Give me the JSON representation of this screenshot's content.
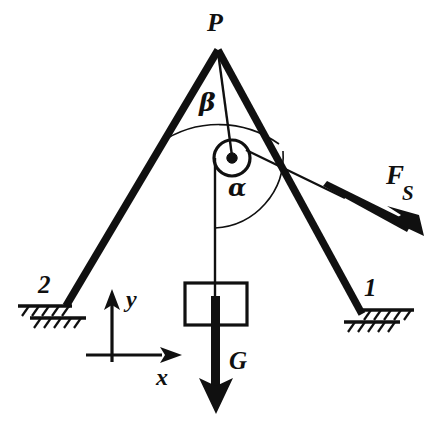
{
  "figure": {
    "background_color": "#ffffff",
    "ink_color": "#101010"
  },
  "labels": {
    "apex": "P",
    "angle_beta": "β",
    "angle_alpha": "α",
    "support_left": "2",
    "support_right": "1",
    "force_cable_symbol": "F",
    "force_cable_subscript": "S",
    "force_weight": "G",
    "axis_x": "x",
    "axis_y": "y"
  },
  "geometry": {
    "apex_point": {
      "x": 218,
      "y": 48
    },
    "support_left_point": {
      "x": 66,
      "y": 306
    },
    "support_right_point": {
      "x": 362,
      "y": 314
    },
    "pulley_center": {
      "x": 232,
      "y": 158
    },
    "pulley_radius": 18,
    "pulley_hub_radius": 5,
    "cable_vertical_x": 215,
    "block_rect": {
      "x": 185,
      "y": 283,
      "w": 62,
      "h": 42
    },
    "weight_arrow_tip": {
      "x": 216,
      "y": 412
    },
    "cable_force_arrow_tip": {
      "x": 418,
      "y": 232
    },
    "axes_origin": {
      "x": 112,
      "y": 355
    },
    "axis_x_tip": {
      "x": 182,
      "y": 355
    },
    "axis_y_tip": {
      "x": 112,
      "y": 291
    }
  },
  "elements": {
    "bar_left_name": "bar-2",
    "bar_right_name": "bar-1",
    "pulley_name": "pulley",
    "block_name": "hanging-block",
    "cable_name": "cable"
  }
}
